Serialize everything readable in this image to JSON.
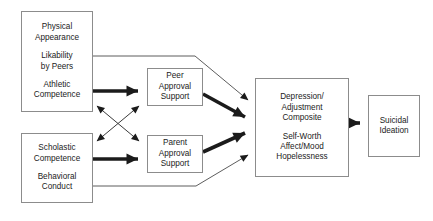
{
  "diagram": {
    "background_color": "#ffffff",
    "box_border_color": "#8c8c8c",
    "arrow_color": "#1b1b1b",
    "nodes": [
      {
        "id": "self-concept-domains",
        "groups": [
          {
            "lines": [
              "Physical",
              "Appearance"
            ]
          },
          {
            "lines": [
              "Likability",
              "by Peers"
            ]
          },
          {
            "lines": [
              "Athletic",
              "Competence"
            ]
          }
        ]
      },
      {
        "id": "school-behavior-domains",
        "groups": [
          {
            "lines": [
              "Scholastic",
              "Competence"
            ]
          },
          {
            "lines": [
              "Behavioral",
              "Conduct"
            ]
          }
        ]
      },
      {
        "id": "peer-approval-support",
        "groups": [
          {
            "lines": [
              "Peer",
              "Approval",
              "Support"
            ]
          }
        ]
      },
      {
        "id": "parent-approval-support",
        "groups": [
          {
            "lines": [
              "Parent",
              "Approval",
              "Support"
            ]
          }
        ]
      },
      {
        "id": "depression-composite",
        "groups": [
          {
            "lines": [
              "Depression/",
              "Adjustment",
              "Composite"
            ]
          },
          {
            "lines": [
              "Self-Worth",
              "Affect/Mood",
              "Hopelessness"
            ]
          }
        ]
      },
      {
        "id": "suicidal-ideation",
        "groups": [
          {
            "lines": [
              "Suicidal",
              "Ideation"
            ]
          }
        ]
      }
    ],
    "edges": [
      {
        "id": "domains-to-peer-approval",
        "from": "self-concept-domains",
        "to": "peer-approval-support",
        "weight": "thick",
        "heads": "single"
      },
      {
        "id": "school-to-parent-approval",
        "from": "school-behavior-domains",
        "to": "parent-approval-support",
        "weight": "thick",
        "heads": "single"
      },
      {
        "id": "peer-approval-to-composite",
        "from": "peer-approval-support",
        "to": "depression-composite",
        "weight": "thick",
        "heads": "single"
      },
      {
        "id": "parent-approval-to-composite",
        "from": "parent-approval-support",
        "to": "depression-composite",
        "weight": "thick",
        "heads": "single"
      },
      {
        "id": "composite-to-ideation",
        "from": "depression-composite",
        "to": "suicidal-ideation",
        "weight": "thick",
        "heads": "single"
      },
      {
        "id": "domains-to-composite-direct",
        "from": "self-concept-domains",
        "to": "depression-composite",
        "weight": "thin",
        "heads": "single"
      },
      {
        "id": "school-to-composite-direct",
        "from": "school-behavior-domains",
        "to": "depression-composite",
        "weight": "thin",
        "heads": "single"
      },
      {
        "id": "domains-to-parent-approval-cross",
        "from": "self-concept-domains",
        "to": "parent-approval-support",
        "weight": "thin",
        "heads": "double"
      },
      {
        "id": "school-to-peer-approval-cross",
        "from": "school-behavior-domains",
        "to": "peer-approval-support",
        "weight": "thin",
        "heads": "double"
      }
    ]
  }
}
